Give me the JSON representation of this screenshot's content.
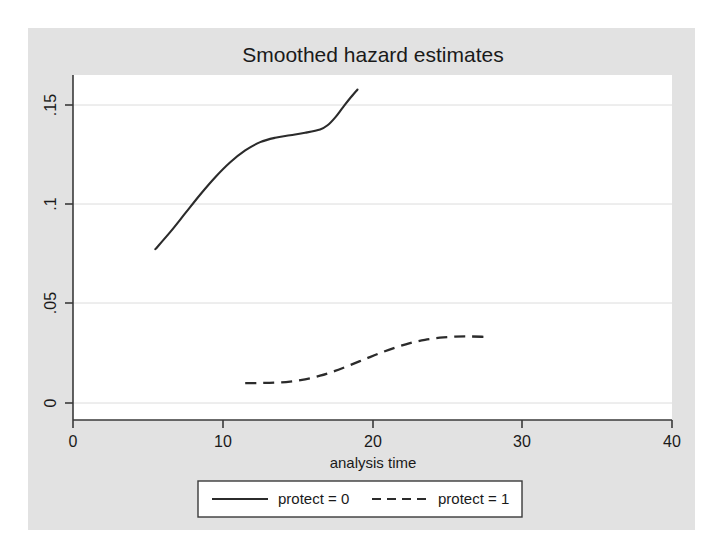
{
  "figure": {
    "background_color": "#ffffff",
    "graph_region_color": "#e2e2e2",
    "plot_area_color": "#ffffff",
    "line_color": "#2b2b2b",
    "grid_color": "#d8d8d8",
    "axis_color": "#3a3a3a"
  },
  "chart_data": {
    "type": "line",
    "title": "Smoothed hazard estimates",
    "xlabel": "analysis time",
    "ylabel": "",
    "xlim": [
      0,
      40
    ],
    "ylim": [
      0,
      0.166
    ],
    "xticks": [
      0,
      10,
      20,
      30,
      40
    ],
    "xtick_labels": [
      "0",
      "10",
      "20",
      "30",
      "40"
    ],
    "yticks": [
      0,
      0.05,
      0.1,
      0.15
    ],
    "ytick_labels": [
      "0",
      ".05",
      ".1",
      ".15"
    ],
    "grid": "horizontal",
    "legend_position": "below",
    "series": [
      {
        "name": "protect = 0",
        "style": "solid",
        "x": [
          5.5,
          6.5,
          7.5,
          8.5,
          9.5,
          10.5,
          11.5,
          12.5,
          13.5,
          14.5,
          15.5,
          16.5,
          17.0,
          17.5,
          18.0,
          18.5,
          19.0
        ],
        "y": [
          0.0822,
          0.0905,
          0.0995,
          0.1085,
          0.1168,
          0.124,
          0.1297,
          0.1337,
          0.1358,
          0.137,
          0.1382,
          0.1398,
          0.1418,
          0.1455,
          0.1502,
          0.1548,
          0.159
        ]
      },
      {
        "name": "protect = 1",
        "style": "dashed",
        "x": [
          11.5,
          12.5,
          13.5,
          14.5,
          15.5,
          16.5,
          17.5,
          18.5,
          19.5,
          20.5,
          21.5,
          22.5,
          23.5,
          24.5,
          25.5,
          26.5,
          27.5
        ],
        "y": [
          0.0177,
          0.0178,
          0.018,
          0.0185,
          0.0196,
          0.0213,
          0.0236,
          0.0264,
          0.0293,
          0.0322,
          0.0348,
          0.037,
          0.0386,
          0.0396,
          0.0401,
          0.0402,
          0.04
        ]
      }
    ]
  },
  "legend": {
    "entries": [
      {
        "label": "protect = 0",
        "style": "solid"
      },
      {
        "label": "protect = 1",
        "style": "dashed"
      }
    ]
  }
}
